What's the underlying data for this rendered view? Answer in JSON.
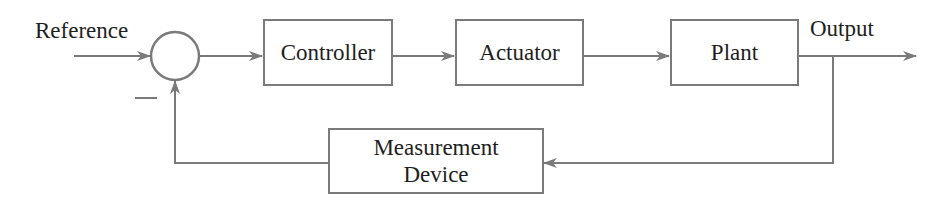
{
  "diagram": {
    "type": "feedback-control-loop",
    "colors": {
      "line": "#7a7a7a",
      "text": "#1e1e1e",
      "background": "#ffffff"
    },
    "input_label": "Reference",
    "output_label": "Output",
    "summing_junction": {
      "feedback_sign": "—"
    },
    "blocks": [
      {
        "id": "controller",
        "label": "Controller"
      },
      {
        "id": "actuator",
        "label": "Actuator"
      },
      {
        "id": "plant",
        "label": "Plant"
      },
      {
        "id": "measurement",
        "label_line1": "Measurement",
        "label_line2": "Device"
      }
    ]
  }
}
